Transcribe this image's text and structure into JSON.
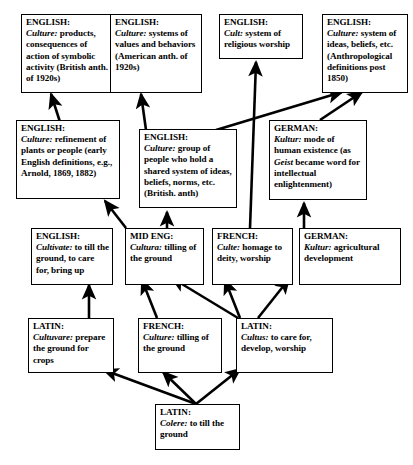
{
  "diagram": {
    "type": "directed-graph",
    "background_color": "#ffffff",
    "line_color": "#000000",
    "box_border_color": "#000000"
  },
  "nodes": [
    {
      "id": "english-products",
      "language": "ENGLISH:",
      "term": "Culture:",
      "definition": " products, consequences of action of symbolic activity (British anth. of 1920s)"
    },
    {
      "id": "english-values",
      "language": "ENGLISH:",
      "term": "Culture:",
      "definition": " systems of values and behaviors (American anth. of 1920s)"
    },
    {
      "id": "english-cult",
      "language": "ENGLISH:",
      "term": "Cult:",
      "definition": " system of religious worship"
    },
    {
      "id": "english-ideas",
      "language": "ENGLISH:",
      "term": "Culture:",
      "definition": " system of ideas, beliefs, etc. (Anthropological definitions post 1850)"
    },
    {
      "id": "english-refinement",
      "language": "ENGLISH:",
      "term": "Culture:",
      "definition": " refinement of plants or people (early English definitions, e.g., Arnold, 1869, 1882)"
    },
    {
      "id": "english-group",
      "language": "ENGLISH:",
      "term": "Culture:",
      "definition": " group of people who hold a shared system of ideas, beliefs, norms, etc. (British. anth)"
    },
    {
      "id": "german-kultur-mode",
      "language": "GERMAN:",
      "term": "Kultur:",
      "definition_part1": " mode of human existence (as ",
      "inline_term": "Geist",
      "definition_part2": " became word for intellectual enlightenment)"
    },
    {
      "id": "english-cultivate",
      "language": "ENGLISH:",
      "term": "Cultivate:",
      "definition": " to till the ground, to care for, bring up"
    },
    {
      "id": "mid-eng-cultura",
      "language": "MID ENG:",
      "term": "Cultura:",
      "definition": " tilling of the ground"
    },
    {
      "id": "french-culte",
      "language": "FRENCH:",
      "term": "Culte:",
      "definition": " homage to deity, worship"
    },
    {
      "id": "german-kultur-agri",
      "language": "GERMAN:",
      "term": "Kultur:",
      "definition": " agricultural development"
    },
    {
      "id": "latin-cultuvare",
      "language": "LATIN:",
      "term": "Cultuvare:",
      "definition": " prepare the ground for crops"
    },
    {
      "id": "french-culture",
      "language": "FRENCH:",
      "term": "Culture:",
      "definition": " tilling of the ground"
    },
    {
      "id": "latin-cultus",
      "language": "LATIN:",
      "term": "Cultus:",
      "definition": " to care for, develop, worship"
    },
    {
      "id": "latin-colere",
      "language": "LATIN:",
      "term": "Colere:",
      "definition": " to till the ground"
    }
  ],
  "edges": [
    {
      "from": "english-refinement",
      "to": "english-products"
    },
    {
      "from": "english-group",
      "to": "english-values"
    },
    {
      "from": "english-group",
      "to": "english-ideas"
    },
    {
      "from": "german-kultur-mode",
      "to": "english-ideas"
    },
    {
      "from": "french-culte",
      "to": "english-cult"
    },
    {
      "from": "mid-eng-cultura",
      "to": "english-refinement"
    },
    {
      "from": "mid-eng-cultura",
      "to": "english-group"
    },
    {
      "from": "german-kultur-agri",
      "to": "german-kultur-mode"
    },
    {
      "from": "latin-cultuvare",
      "to": "english-cultivate"
    },
    {
      "from": "french-culture",
      "to": "mid-eng-cultura"
    },
    {
      "from": "latin-cultus",
      "to": "mid-eng-cultura"
    },
    {
      "from": "latin-cultus",
      "to": "french-culte"
    },
    {
      "from": "latin-cultus",
      "to": "german-kultur-agri"
    },
    {
      "from": "latin-colere",
      "to": "latin-cultuvare"
    },
    {
      "from": "latin-colere",
      "to": "french-culture"
    },
    {
      "from": "latin-colere",
      "to": "latin-cultus"
    }
  ]
}
